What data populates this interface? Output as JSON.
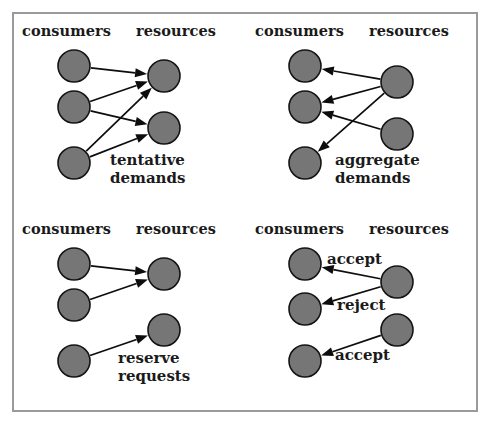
{
  "figure": {
    "border_color": "#9a9a9a",
    "node_fill": "#767676",
    "node_stroke": "#141414",
    "edge_color": "#0d0d0d",
    "background": "#ffffff"
  },
  "headings": {
    "consumers": "consumers",
    "resources": "resources"
  },
  "panels": [
    {
      "id": "tentative-demands",
      "label_line1": "tentative",
      "label_line2": "demands",
      "label_x": 96,
      "label_y": 138,
      "direction": "consumers-to-resources",
      "consumers": [
        {
          "cx": 60,
          "cy": 52,
          "r": 16
        },
        {
          "cx": 60,
          "cy": 93,
          "r": 16
        },
        {
          "cx": 60,
          "cy": 149,
          "r": 16
        }
      ],
      "resources": [
        {
          "cx": 150,
          "cy": 62,
          "r": 16
        },
        {
          "cx": 150,
          "cy": 114,
          "r": 16
        }
      ],
      "edges": [
        {
          "from": "c0",
          "to": "r0"
        },
        {
          "from": "c1",
          "to": "r0"
        },
        {
          "from": "c1",
          "to": "r1"
        },
        {
          "from": "c2",
          "to": "r0"
        },
        {
          "from": "c2",
          "to": "r1"
        }
      ]
    },
    {
      "id": "aggregate-demands",
      "label_line1": "aggregate",
      "label_line2": "demands",
      "label_x": 88,
      "label_y": 138,
      "direction": "resources-to-consumers",
      "consumers": [
        {
          "cx": 58,
          "cy": 52,
          "r": 16
        },
        {
          "cx": 58,
          "cy": 93,
          "r": 16
        },
        {
          "cx": 58,
          "cy": 149,
          "r": 16
        }
      ],
      "resources": [
        {
          "cx": 150,
          "cy": 68,
          "r": 16
        },
        {
          "cx": 150,
          "cy": 120,
          "r": 16
        }
      ],
      "edges": [
        {
          "from": "r0",
          "to": "c0"
        },
        {
          "from": "r0",
          "to": "c1"
        },
        {
          "from": "r0",
          "to": "c2"
        },
        {
          "from": "r1",
          "to": "c1"
        }
      ]
    },
    {
      "id": "reserve-requests",
      "label_line1": "reserve",
      "label_line2": "requests",
      "label_x": 104,
      "label_y": 138,
      "direction": "consumers-to-resources",
      "consumers": [
        {
          "cx": 60,
          "cy": 52,
          "r": 16
        },
        {
          "cx": 60,
          "cy": 93,
          "r": 16
        },
        {
          "cx": 60,
          "cy": 149,
          "r": 16
        }
      ],
      "resources": [
        {
          "cx": 150,
          "cy": 62,
          "r": 16
        },
        {
          "cx": 150,
          "cy": 118,
          "r": 16
        }
      ],
      "edges": [
        {
          "from": "c0",
          "to": "r0"
        },
        {
          "from": "c1",
          "to": "r0"
        },
        {
          "from": "c2",
          "to": "r1"
        }
      ]
    },
    {
      "id": "accept-reject",
      "label_line1": "",
      "label_line2": "",
      "label_x": 0,
      "label_y": 0,
      "direction": "resources-to-consumers",
      "consumers": [
        {
          "cx": 58,
          "cy": 52,
          "r": 16
        },
        {
          "cx": 58,
          "cy": 97,
          "r": 16
        },
        {
          "cx": 58,
          "cy": 149,
          "r": 16
        }
      ],
      "resources": [
        {
          "cx": 150,
          "cy": 70,
          "r": 16
        },
        {
          "cx": 150,
          "cy": 118,
          "r": 16
        }
      ],
      "edges": [
        {
          "from": "r0",
          "to": "c0",
          "label": "accept"
        },
        {
          "from": "r0",
          "to": "c1",
          "label": "reject"
        },
        {
          "from": "r1",
          "to": "c2",
          "label": "accept"
        }
      ],
      "edge_labels": [
        {
          "text": "accept",
          "x": 80,
          "y": 38
        },
        {
          "text": "reject",
          "x": 90,
          "y": 84
        },
        {
          "text": "accept",
          "x": 88,
          "y": 134
        }
      ]
    }
  ],
  "panel_positions": [
    {
      "left": 0,
      "top": 0
    },
    {
      "left": 233,
      "top": 0
    },
    {
      "left": 0,
      "top": 198
    },
    {
      "left": 233,
      "top": 198
    }
  ]
}
